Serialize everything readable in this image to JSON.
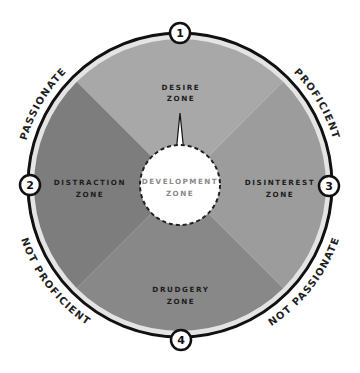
{
  "diagram": {
    "center_zone": {
      "line1": "DEVELOPMENT",
      "line2": "ZONE"
    },
    "zones": [
      {
        "id": "desire",
        "number": "1",
        "line1": "DESIRE",
        "line2": "ZONE",
        "color": "#a8a8a8"
      },
      {
        "id": "distraction",
        "number": "2",
        "line1": "DISTRACTION",
        "line2": "ZONE",
        "color": "#7d7d7d"
      },
      {
        "id": "disinterest",
        "number": "3",
        "line1": "DISINTEREST",
        "line2": "ZONE",
        "color": "#9c9c9c"
      },
      {
        "id": "drudgery",
        "number": "4",
        "line1": "DRUDGERY",
        "line2": "ZONE",
        "color": "#888888"
      }
    ],
    "axis_labels": {
      "top_left": "PASSIONATE",
      "top_right": "PROFICIENT",
      "bottom_left": "NOT PROFICIENT",
      "bottom_right": "NOT PASSIONATE"
    },
    "colors": {
      "ring": "#e4e4e4",
      "outline": "#111111",
      "center": "#ffffff"
    }
  }
}
